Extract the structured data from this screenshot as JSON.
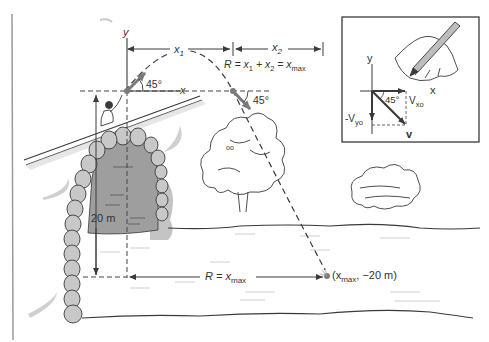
{
  "diagram": {
    "type": "projectile-motion-illustration",
    "colors": {
      "line": "#3a3a3a",
      "stone_fill": "#c8c8c8",
      "tunnel_fill": "#9e9e9e",
      "shadow": "#bdbdbd",
      "accent_arrow": "#7a7a7a",
      "dashed": "#444444"
    },
    "labels": {
      "y_axis": "y",
      "x_axis": "x",
      "x1": "x",
      "x1_sub": "1",
      "x2": "x",
      "x2_sub": "2",
      "range_eq_prefix": "R = x",
      "range_eq_sub1": "1",
      "range_eq_mid": " + x",
      "range_eq_sub2": "2",
      "range_eq_eq": " = x",
      "range_eq_sub3": "max",
      "angle_launch": "45°",
      "angle_land": "45°",
      "height": "20 m",
      "bottom_range_prefix": "R = x",
      "bottom_range_sub": "max",
      "landing_point_prefix": "(x",
      "landing_point_sub": "max",
      "landing_point_suffix": ", −20 m)"
    },
    "inset": {
      "y_axis": "y",
      "x_axis": "x",
      "angle": "45°",
      "vx": "V",
      "vx_sub": "xo",
      "vy": "-V",
      "vy_sub": "yo",
      "v": "v"
    }
  }
}
